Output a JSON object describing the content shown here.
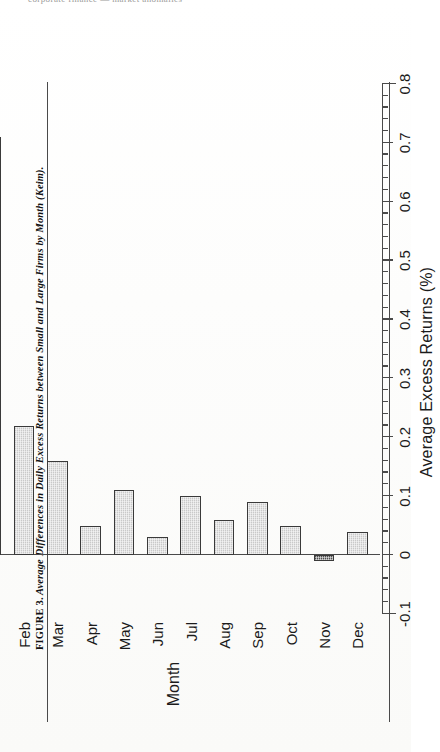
{
  "page": {
    "top_fragment": "corporate finance — market anomalies"
  },
  "caption": {
    "figure_number": "FIGURE 3.",
    "text": "Average Differences in Daily Excess Returns between Small and Large Firms by Month (Keim)."
  },
  "chart_data": {
    "type": "bar",
    "orientation": "vertical",
    "title": "",
    "categories": [
      "Jan",
      "Feb",
      "Mar",
      "Apr",
      "May",
      "Jun",
      "Jul",
      "Aug",
      "Sep",
      "Oct",
      "Nov",
      "Dec"
    ],
    "values": [
      0.71,
      0.22,
      0.16,
      0.05,
      0.11,
      0.03,
      0.1,
      0.06,
      0.09,
      0.05,
      -0.01,
      0.04
    ],
    "xlabel": "Month",
    "ylabel": "Average Excess Returns (%)",
    "ylim": [
      -0.1,
      0.8
    ],
    "ytick_labels": [
      "-0.1",
      "0",
      "0.1",
      "0.2",
      "0.3",
      "0.4",
      "0.5",
      "0.6",
      "0.7",
      "0.8"
    ],
    "ytick_values": [
      -0.1,
      0,
      0.1,
      0.2,
      0.3,
      0.4,
      0.5,
      0.6,
      0.7,
      0.8
    ],
    "minor_ticks_per_interval": 4,
    "grid": false,
    "legend": null,
    "bar_fill_color": "#c9c9c9",
    "bar_edge_color": "#3a3a3a",
    "axis_color": "#4a4a4a",
    "rotation_note": "figure printed rotated 90 degrees on the page"
  }
}
